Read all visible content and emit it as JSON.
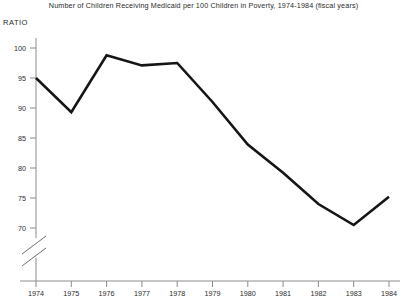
{
  "chart_data": {
    "type": "line",
    "title": "Number of Children Receiving Medicaid per 100 Children in Poverty, 1974-1984 (fiscal years)",
    "ylabel": "RATIO",
    "xlabel": "",
    "categories": [
      "1974",
      "1975",
      "1976",
      "1977",
      "1978",
      "1979",
      "1980",
      "1981",
      "1982",
      "1983",
      "1984"
    ],
    "x": [
      1974,
      1975,
      1976,
      1977,
      1978,
      1979,
      1980,
      1981,
      1982,
      1983,
      1984
    ],
    "values": [
      95.0,
      89.3,
      98.8,
      97.1,
      97.5,
      91.0,
      83.9,
      79.2,
      74.0,
      70.5,
      75.2
    ],
    "series": [
      {
        "name": "Children receiving Medicaid per 100 children in poverty",
        "values": [
          95.0,
          89.3,
          98.8,
          97.1,
          97.5,
          91.0,
          83.9,
          79.2,
          74.0,
          70.5,
          75.2
        ]
      }
    ],
    "ylim": [
      68.5,
      101.5
    ],
    "yticks": [
      70,
      75,
      80,
      85,
      90,
      95,
      100
    ],
    "ytick_labels": [
      "70",
      "75",
      "80",
      "85",
      "90",
      "95",
      "100"
    ],
    "xlim": [
      1973.6,
      1984.4
    ],
    "grid": false,
    "legend": false,
    "axis_break": true,
    "line_color": "#151515",
    "axis_color": "#8c8c8c",
    "background": "#ffffff"
  }
}
